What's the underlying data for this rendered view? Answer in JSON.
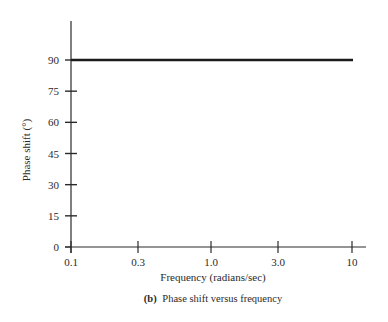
{
  "chart_data": {
    "type": "line",
    "title": "",
    "caption_label": "(b)",
    "caption_text": "Phase shift versus frequency",
    "xlabel": "Frequency (radians/sec)",
    "ylabel": "Phase shift (°)",
    "xscale": "log",
    "xlim": [
      0.1,
      10
    ],
    "ylim": [
      0,
      90
    ],
    "x_ticks": [
      "0.1",
      "0.3",
      "1.0",
      "3.0",
      "10"
    ],
    "x_tick_values": [
      0.1,
      0.3,
      1.0,
      3.0,
      10
    ],
    "y_ticks": [
      "0",
      "15",
      "30",
      "45",
      "60",
      "75",
      "90"
    ],
    "y_tick_values": [
      0,
      15,
      30,
      45,
      60,
      75,
      90
    ],
    "grid": false,
    "legend": null,
    "series": [
      {
        "name": "Phase shift",
        "x": [
          0.1,
          10
        ],
        "y": [
          90,
          90
        ],
        "color": "#1a1a1a"
      }
    ]
  },
  "layout": {
    "plot_left": 71,
    "plot_right": 353,
    "y0_px": 247,
    "y90_px": 60,
    "axis_top_px": 21,
    "x_axis_end_px": 366,
    "x_tick_px": [
      71,
      138,
      211,
      278,
      352
    ]
  }
}
